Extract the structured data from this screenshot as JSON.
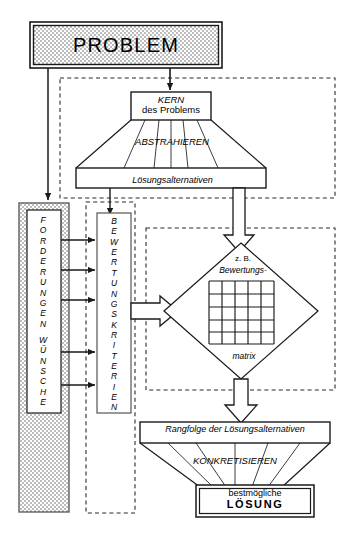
{
  "diagram": {
    "language": "de",
    "nodes": {
      "problem": "PROBLEM",
      "kern_line1": "KERN",
      "kern_line2": "des Problems",
      "abstrahieren": "ABSTRAHIEREN",
      "loesungsalternativen": "Lösungsalternativen",
      "forderungen_wuensche": "FORDERUNGEN  WÜNSCHE",
      "bewertungskriterien": "BEWERTUNGSKRITERIEN",
      "zb": "z. B.",
      "bewertungs": "Bewertungs-",
      "matrix": "matrix",
      "rangfolge": "Rangfolge der Lösungsalternativen",
      "konkretisieren": "KONKRETISIEREN",
      "loesung_line1": "bestmögliche",
      "loesung_line2": "LÖSUNG"
    },
    "colors": {
      "stroke": "#1a1a1a",
      "background": "#ffffff",
      "hatch_fill": "#c9c9c9",
      "dashed_stroke": "#2a2a2a"
    },
    "matrix": {
      "rows": 5,
      "cols": 5
    },
    "connector_arrows_count": 5
  }
}
